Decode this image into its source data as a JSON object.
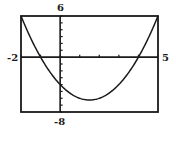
{
  "chart_data": {
    "type": "line",
    "title": "",
    "xlabel": "",
    "ylabel": "",
    "function": "y = x^2 - 3x - 4",
    "xlim": [
      -2,
      5
    ],
    "ylim": [
      -8,
      6
    ],
    "x_tick_step": 1,
    "y_tick_step": 1,
    "grid": false,
    "legend": null,
    "series": [
      {
        "name": "parabola",
        "x": [
          -2,
          -1.5,
          -1,
          -0.5,
          0,
          0.5,
          1,
          1.5,
          2,
          2.5,
          3,
          3.5,
          4,
          4.5,
          5
        ],
        "values": [
          6,
          2.75,
          0,
          -2.25,
          -4,
          -5.25,
          -6,
          -6.25,
          -6,
          -5.25,
          -4,
          -2.25,
          0,
          2.75,
          6
        ]
      }
    ],
    "annotations": {
      "x_intercepts": [
        -1,
        4
      ],
      "y_intercept": -4,
      "vertex": [
        1.5,
        -6.25
      ]
    }
  },
  "labels": {
    "ymax": "6",
    "ymin": "-8",
    "xmin": "-2",
    "xmax": "5"
  },
  "colors": {
    "ink": "#1a1a1a",
    "background": "#ffffff"
  }
}
